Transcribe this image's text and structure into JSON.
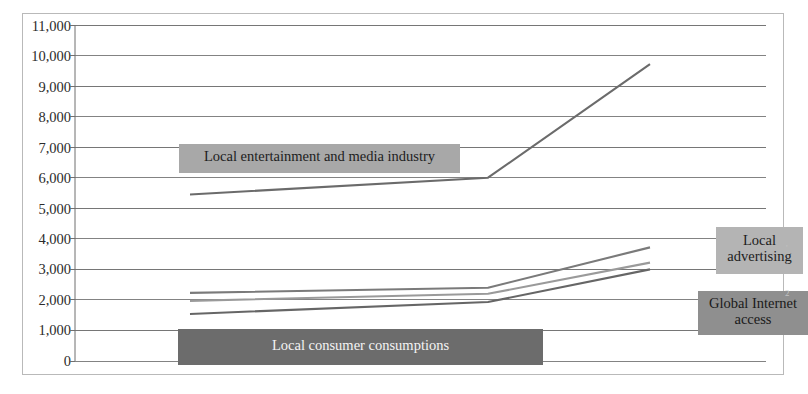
{
  "chart_data": {
    "type": "line",
    "title": "",
    "xlabel": "",
    "ylabel": "",
    "grid": true,
    "legend_position": "inline-callouts",
    "ylim": [
      0,
      11000
    ],
    "yticks": [
      0,
      1000,
      2000,
      3000,
      4000,
      5000,
      6000,
      7000,
      8000,
      9000,
      10000,
      11000
    ],
    "ytick_labels": [
      "0",
      "1,000",
      "2,000",
      "3,000",
      "4,000",
      "5,000",
      "6,000",
      "7,000",
      "8,000",
      "9,000",
      "10,000",
      "11,000"
    ],
    "x": [
      1,
      2,
      3
    ],
    "xtick_labels": [
      "",
      "",
      ""
    ],
    "series": [
      {
        "name": "Local entertainment and media industry",
        "color": "#6b6b6b",
        "values": [
          5450,
          6000,
          9720
        ]
      },
      {
        "name": "Local advertising",
        "color": "#7a7a7a",
        "values": [
          2230,
          2400,
          3720
        ]
      },
      {
        "name": "Local consumer consumptions",
        "color": "#9a9a9a",
        "values": [
          1970,
          2200,
          3220
        ]
      },
      {
        "name": "Global Internet access",
        "color": "#666666",
        "values": [
          1540,
          1930,
          3000
        ]
      }
    ],
    "annotations": [
      {
        "id": "callout-entertainment",
        "text": "Local entertainment and media industry",
        "background": "#a8a8a8",
        "text_color": "#1d1d1d"
      },
      {
        "id": "callout-consumer",
        "text": "Local consumer consumptions",
        "background": "#6c6c6c",
        "text_color": "#f4f4f4"
      },
      {
        "id": "callout-advertising",
        "text": "Local advertising",
        "background": "#b4b4b4",
        "text_color": "#1d1d1d"
      },
      {
        "id": "callout-global",
        "text": "Global Internet access",
        "background": "#8f8f8f",
        "text_color": "#1a1a1a"
      }
    ]
  },
  "axis": {
    "labels": {
      "t11000": "11,000",
      "t10000": "10,000",
      "t9000": "9,000",
      "t8000": "8,000",
      "t7000": "7,000",
      "t6000": "6,000",
      "t5000": "5,000",
      "t4000": "4,000",
      "t3000": "3,000",
      "t2000": "2,000",
      "t1000": "1,000",
      "t0": "0"
    }
  },
  "callouts": {
    "entertainment": "Local entertainment and media industry",
    "consumer": "Local consumer consumptions",
    "advertising_line1": "Local",
    "advertising_line2": "advertising",
    "global_line1": "Global Internet",
    "global_line2": "access"
  },
  "colors": {
    "frame_border": "#b9b9b9",
    "gridline": "#767676",
    "axis_line": "#6f6f6f",
    "plot_background": "#ffffff"
  }
}
